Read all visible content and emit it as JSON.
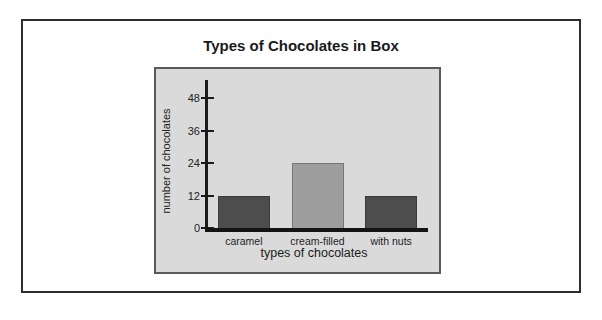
{
  "chart_data": {
    "type": "bar",
    "title": "Types of Chocolates in Box",
    "xlabel": "types of chocolates",
    "ylabel": "number of chocolates",
    "categories": [
      "caramel",
      "cream-filled",
      "with nuts"
    ],
    "values": [
      12,
      24,
      12
    ],
    "bar_colors": [
      "#4d4d4d",
      "#9e9e9e",
      "#4d4d4d"
    ],
    "yticks": [
      0,
      12,
      24,
      36,
      48
    ],
    "ylim": [
      0,
      54
    ],
    "grid": false,
    "legend": "none",
    "panel_background": "#dadada",
    "axis_color": "#1a1a1a"
  }
}
